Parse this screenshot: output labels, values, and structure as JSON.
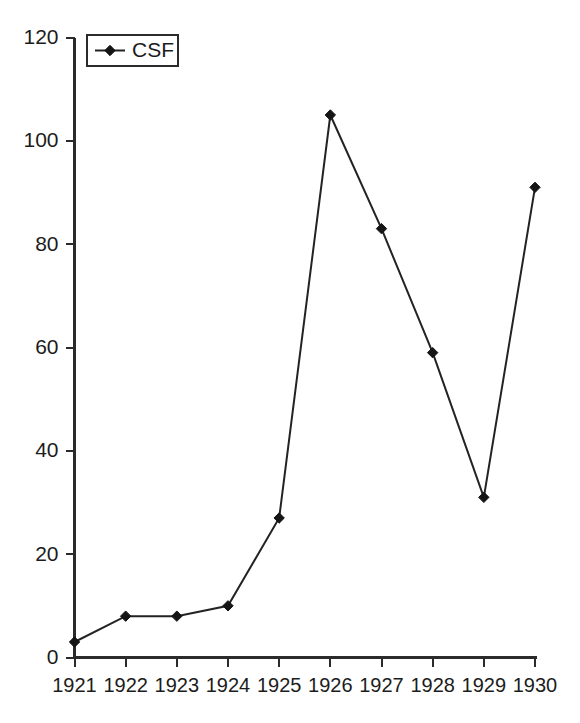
{
  "chart_data": {
    "type": "line",
    "title": "",
    "subtitle": "",
    "xlabel": "",
    "ylabel": "",
    "categories": [
      "1921",
      "1922",
      "1923",
      "1924",
      "1925",
      "1926",
      "1927",
      "1928",
      "1929",
      "1930"
    ],
    "x": [
      1921,
      1922,
      1923,
      1924,
      1925,
      1926,
      1927,
      1928,
      1929,
      1930
    ],
    "series": [
      {
        "name": "CSF",
        "values": [
          3,
          8,
          8,
          10,
          27,
          105,
          83,
          59,
          31,
          91
        ],
        "marker": "diamond",
        "color": "#1a1a1a"
      }
    ],
    "ylim": [
      0,
      120
    ],
    "yticks": [
      0,
      20,
      40,
      60,
      80,
      100,
      120
    ],
    "ytick_labels": [
      "0",
      "20",
      "40",
      "60",
      "80",
      "100",
      "120"
    ],
    "xtick_labels": [
      "1921",
      "1922",
      "1923",
      "1924",
      "1925",
      "1926",
      "1927",
      "1928",
      "1929",
      "1930"
    ],
    "grid": false,
    "legend": {
      "position": "top-left",
      "entries": [
        "CSF"
      ],
      "border": true
    },
    "background": "#ffffff",
    "axis_color": "#2b2b2b"
  },
  "legend": {
    "csf_label": "CSF"
  },
  "axes": {
    "y_tick_0": "0",
    "y_tick_1": "20",
    "y_tick_2": "40",
    "y_tick_3": "60",
    "y_tick_4": "80",
    "y_tick_5": "100",
    "y_tick_6": "120",
    "x_tick_0": "1921",
    "x_tick_1": "1922",
    "x_tick_2": "1923",
    "x_tick_3": "1924",
    "x_tick_4": "1925",
    "x_tick_5": "1926",
    "x_tick_6": "1927",
    "x_tick_7": "1928",
    "x_tick_8": "1929",
    "x_tick_9": "1930"
  }
}
